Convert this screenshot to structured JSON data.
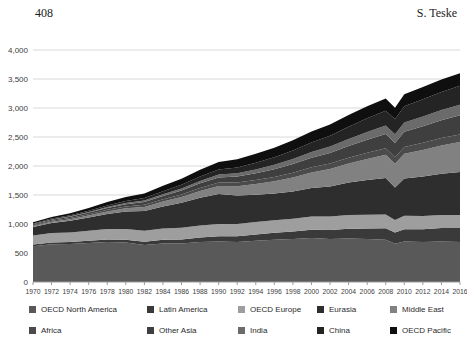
{
  "header": {
    "page_number": "408",
    "author": "S. Teske"
  },
  "colors": {
    "page_background": "#ffffff",
    "gridline": "#d9d9d9",
    "axis": "#9b9b9b",
    "tick_label": "#404040",
    "header_text": "#1c1c1c"
  },
  "chart_data": {
    "type": "area",
    "stacked": true,
    "title": "",
    "xlabel": "",
    "ylabel": "",
    "grid": true,
    "legend_position": "bottom",
    "ylim": [
      0,
      4000
    ],
    "yticks": [
      "0",
      "500",
      "1,000",
      "1,500",
      "2,000",
      "2,500",
      "3,000",
      "3,500",
      "4,000"
    ],
    "xticks": [
      1970,
      1972,
      1974,
      1976,
      1978,
      1980,
      1982,
      1984,
      1986,
      1988,
      1990,
      1992,
      1994,
      1996,
      1998,
      2000,
      2002,
      2004,
      2006,
      2008,
      2010,
      2012,
      2014,
      2016
    ],
    "x": [
      1970,
      1972,
      1974,
      1976,
      1978,
      1980,
      1982,
      1984,
      1986,
      1988,
      1990,
      1992,
      1994,
      1996,
      1998,
      2000,
      2002,
      2004,
      2006,
      2008,
      2009,
      2010,
      2012,
      2014,
      2016
    ],
    "series": [
      {
        "name": "OECD North America",
        "color": "#595959",
        "values": [
          615,
          650,
          655,
          670,
          690,
          680,
          640,
          665,
          665,
          690,
          700,
          690,
          710,
          730,
          740,
          760,
          740,
          750,
          740,
          730,
          660,
          700,
          690,
          700,
          690
        ]
      },
      {
        "name": "Latin America",
        "color": "#3a3a3a",
        "values": [
          30,
          33,
          36,
          40,
          45,
          50,
          55,
          62,
          70,
          78,
          88,
          98,
          108,
          118,
          130,
          142,
          155,
          168,
          180,
          195,
          196,
          210,
          220,
          230,
          240
        ]
      },
      {
        "name": "OECD Europe",
        "color": "#9e9e9e",
        "values": [
          155,
          160,
          165,
          172,
          178,
          185,
          190,
          195,
          200,
          205,
          210,
          212,
          215,
          218,
          222,
          228,
          232,
          235,
          238,
          240,
          215,
          232,
          228,
          226,
          225
        ]
      },
      {
        "name": "Eurasia",
        "color": "#2e2e2e",
        "values": [
          150,
          175,
          200,
          230,
          260,
          300,
          340,
          380,
          430,
          480,
          520,
          490,
          470,
          460,
          470,
          490,
          520,
          560,
          600,
          630,
          560,
          640,
          680,
          710,
          740
        ]
      },
      {
        "name": "Middle East",
        "color": "#818181",
        "values": [
          15,
          20,
          26,
          34,
          44,
          56,
          70,
          85,
          100,
          118,
          138,
          160,
          185,
          210,
          240,
          270,
          300,
          330,
          365,
          400,
          408,
          430,
          460,
          490,
          520
        ]
      },
      {
        "name": "Africa",
        "color": "#4b4b4b",
        "values": [
          15,
          17,
          20,
          23,
          27,
          31,
          36,
          41,
          46,
          52,
          58,
          64,
          70,
          76,
          82,
          88,
          95,
          100,
          106,
          112,
          113,
          118,
          122,
          126,
          130
        ]
      },
      {
        "name": "Other Asia",
        "color": "#3f3f3f",
        "values": [
          15,
          18,
          22,
          27,
          33,
          40,
          48,
          57,
          67,
          78,
          90,
          103,
          117,
          132,
          148,
          165,
          183,
          202,
          222,
          243,
          246,
          262,
          285,
          308,
          330
        ]
      },
      {
        "name": "India",
        "color": "#6b6b6b",
        "values": [
          5,
          7,
          9,
          12,
          15,
          19,
          24,
          29,
          35,
          42,
          50,
          58,
          67,
          77,
          88,
          99,
          111,
          123,
          136,
          148,
          150,
          158,
          166,
          173,
          180
        ]
      },
      {
        "name": "China",
        "color": "#242424",
        "values": [
          10,
          13,
          17,
          22,
          28,
          35,
          43,
          52,
          62,
          74,
          87,
          100,
          115,
          130,
          147,
          165,
          185,
          210,
          235,
          255,
          262,
          280,
          300,
          315,
          330
        ]
      },
      {
        "name": "OECD Pacific",
        "color": "#0f0f0f",
        "values": [
          20,
          28,
          37,
          47,
          57,
          68,
          80,
          92,
          104,
          117,
          130,
          142,
          154,
          165,
          176,
          186,
          195,
          202,
          208,
          212,
          195,
          208,
          210,
          213,
          215
        ]
      }
    ]
  }
}
